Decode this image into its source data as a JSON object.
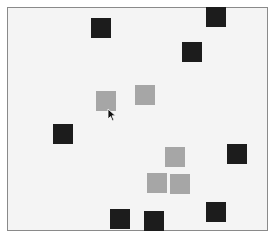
{
  "board": {
    "background": "#f4f4f4",
    "border": "#8a8a8a"
  },
  "colors": {
    "dark_square": "#1c1c1c",
    "light_square": "#a6a6a6"
  },
  "squares": [
    {
      "type": "dark",
      "x": 91,
      "y": 18
    },
    {
      "type": "dark",
      "x": 206,
      "y": 7
    },
    {
      "type": "dark",
      "x": 182,
      "y": 42
    },
    {
      "type": "light",
      "x": 96,
      "y": 91
    },
    {
      "type": "light",
      "x": 135,
      "y": 85
    },
    {
      "type": "dark",
      "x": 53,
      "y": 124
    },
    {
      "type": "light",
      "x": 165,
      "y": 147
    },
    {
      "type": "dark",
      "x": 227,
      "y": 144
    },
    {
      "type": "light",
      "x": 147,
      "y": 173
    },
    {
      "type": "light",
      "x": 170,
      "y": 174
    },
    {
      "type": "dark",
      "x": 110,
      "y": 209
    },
    {
      "type": "dark",
      "x": 144,
      "y": 211
    },
    {
      "type": "dark",
      "x": 206,
      "y": 202
    }
  ],
  "cursor": {
    "x": 107,
    "y": 108
  }
}
